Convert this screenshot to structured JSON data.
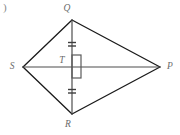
{
  "figure": {
    "kind": "geometry-figure",
    "corner_mark": ")",
    "colors": {
      "background": "#ffffff",
      "edge": "#1a1a1a",
      "diagonal": "#4d4d4d",
      "tick": "#3d3d3d",
      "right_angle": "#5a5a5a",
      "label": "#6b6b6b"
    },
    "vertices": [
      {
        "id": "Q",
        "label": "Q",
        "x": 72,
        "y": 20,
        "label_x": 67,
        "label_y": 9
      },
      {
        "id": "S",
        "label": "S",
        "x": 23,
        "y": 67,
        "label_x": 12,
        "label_y": 67
      },
      {
        "id": "P",
        "label": "P",
        "x": 160,
        "y": 67,
        "label_x": 170,
        "label_y": 67
      },
      {
        "id": "R",
        "label": "R",
        "x": 72,
        "y": 114,
        "label_x": 68,
        "label_y": 125
      },
      {
        "id": "T",
        "label": "T",
        "x": 72,
        "y": 67,
        "label_x": 62,
        "label_y": 61
      }
    ],
    "edges": [
      {
        "from": "S",
        "to": "Q"
      },
      {
        "from": "Q",
        "to": "P"
      },
      {
        "from": "P",
        "to": "R"
      },
      {
        "from": "R",
        "to": "S"
      }
    ],
    "diagonals": [
      {
        "from": "Q",
        "to": "R",
        "orientation": "vertical"
      },
      {
        "from": "S",
        "to": "P",
        "orientation": "horizontal"
      }
    ],
    "tick_marks": [
      {
        "on_segment": "QT",
        "count": 2,
        "x": 72,
        "y": 44,
        "half_width": 4,
        "gap": 3
      },
      {
        "on_segment": "TR",
        "count": 2,
        "x": 72,
        "y": 91,
        "half_width": 4,
        "gap": 3
      }
    ],
    "right_angle": {
      "at_vertex": "T",
      "x": 72,
      "y": 55,
      "width": 9,
      "height": 23
    }
  }
}
